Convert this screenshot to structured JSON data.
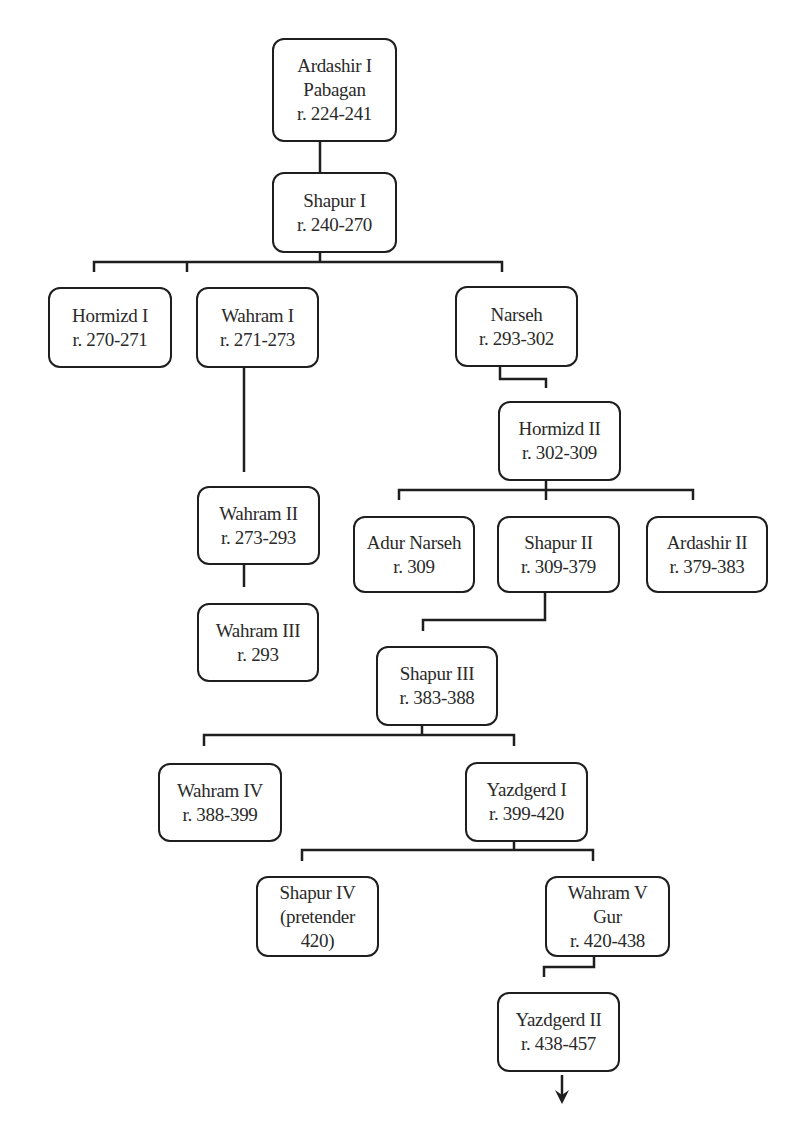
{
  "diagram": {
    "type": "family-tree",
    "nodes": [
      {
        "id": "ardashir1",
        "lines": [
          "Ardashir I",
          "Pabagan",
          "r. 224-241"
        ]
      },
      {
        "id": "shapur1",
        "lines": [
          "Shapur I",
          "r. 240-270"
        ]
      },
      {
        "id": "hormizd1",
        "lines": [
          "Hormizd I",
          "r. 270-271"
        ]
      },
      {
        "id": "wahram1",
        "lines": [
          "Wahram I",
          "r. 271-273"
        ]
      },
      {
        "id": "narseh",
        "lines": [
          "Narseh",
          "r. 293-302"
        ]
      },
      {
        "id": "hormizd2",
        "lines": [
          "Hormizd II",
          "r. 302-309"
        ]
      },
      {
        "id": "wahram2",
        "lines": [
          "Wahram II",
          "r. 273-293"
        ]
      },
      {
        "id": "adurnarseh",
        "lines": [
          "Adur Narseh",
          "r. 309"
        ]
      },
      {
        "id": "shapur2",
        "lines": [
          "Shapur II",
          "r. 309-379"
        ]
      },
      {
        "id": "ardashir2",
        "lines": [
          "Ardashir II",
          "r. 379-383"
        ]
      },
      {
        "id": "wahram3",
        "lines": [
          "Wahram III",
          "r. 293"
        ]
      },
      {
        "id": "shapur3",
        "lines": [
          "Shapur III",
          "r. 383-388"
        ]
      },
      {
        "id": "wahram4",
        "lines": [
          "Wahram IV",
          "r. 388-399"
        ]
      },
      {
        "id": "yazdgerd1",
        "lines": [
          "Yazdgerd I",
          "r. 399-420"
        ]
      },
      {
        "id": "shapur4",
        "lines": [
          "Shapur IV",
          "(pretender",
          "420)"
        ]
      },
      {
        "id": "wahram5",
        "lines": [
          "Wahram V",
          "Gur",
          "r. 420-438"
        ]
      },
      {
        "id": "yazdgerd2",
        "lines": [
          "Yazdgerd II",
          "r. 438-457"
        ]
      }
    ],
    "edges": [
      [
        "ardashir1",
        "shapur1"
      ],
      [
        "shapur1",
        "hormizd1"
      ],
      [
        "shapur1",
        "wahram1"
      ],
      [
        "shapur1",
        "narseh"
      ],
      [
        "wahram1",
        "wahram2"
      ],
      [
        "wahram2",
        "wahram3"
      ],
      [
        "narseh",
        "hormizd2"
      ],
      [
        "hormizd2",
        "adurnarseh"
      ],
      [
        "hormizd2",
        "shapur2"
      ],
      [
        "hormizd2",
        "ardashir2"
      ],
      [
        "shapur2",
        "shapur3"
      ],
      [
        "shapur3",
        "wahram4"
      ],
      [
        "shapur3",
        "yazdgerd1"
      ],
      [
        "yazdgerd1",
        "shapur4"
      ],
      [
        "yazdgerd1",
        "wahram5"
      ],
      [
        "wahram5",
        "yazdgerd2"
      ]
    ],
    "continuation_arrow": "down-arrow below Yazdgerd II"
  }
}
